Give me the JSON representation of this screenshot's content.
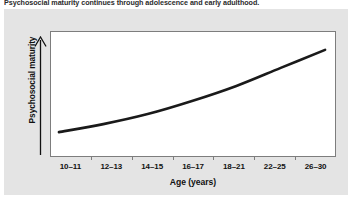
{
  "caption": {
    "text": "Psychosocial maturity continues through adolescence and early adulthood."
  },
  "colors": {
    "panel_background": "#e4e4e4",
    "plot_background": "#ffffff",
    "plot_border": "#7d7d7d",
    "curve": "#1a1a1a",
    "text": "#111111"
  },
  "chart_data": {
    "type": "line",
    "title": "Psychosocial maturity continues through adolescence and early adulthood.",
    "xlabel": "Age (years)",
    "ylabel": "Psychosocial maturity",
    "categories": [
      "10–11",
      "12–13",
      "14–15",
      "16–17",
      "18–21",
      "22–25",
      "26–30"
    ],
    "series": [
      {
        "name": "Psychosocial maturity",
        "values": [
          12,
          20,
          30,
          43,
          58,
          76,
          94
        ]
      }
    ],
    "ylim": [
      0,
      100
    ],
    "y_axis_ticks_shown": false,
    "y_axis_arrow": true,
    "grid": false,
    "legend": "none",
    "curve_shape": "monotonic increasing, concave up (accelerating)"
  },
  "axis": {
    "y_arrow_icon": "up-arrow-icon"
  }
}
